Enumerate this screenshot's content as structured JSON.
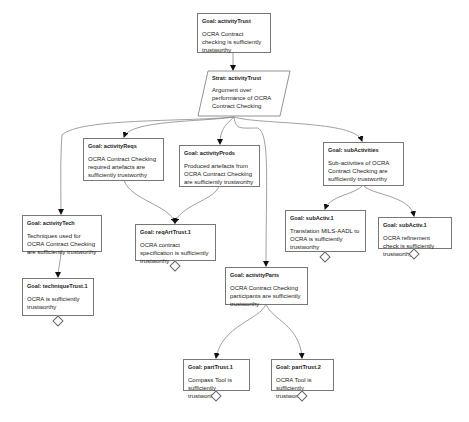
{
  "diagram": {
    "type": "GSN assurance case",
    "nodes": {
      "activityTrust": {
        "kind": "goal",
        "title": "Goal: activityTrust",
        "text": "OCRA Contract checking is sufficiently trustworthy"
      },
      "stratActivityTrust": {
        "kind": "strategy",
        "title": "Strat: activityTrust",
        "text": "Argument over performance of OCRA Contract Checking"
      },
      "activityReqs": {
        "kind": "goal",
        "title": "Goal: activityReqs",
        "text": "OCRA Contract Checking required artefacts are sufficiently trustworthy"
      },
      "activityProds": {
        "kind": "goal",
        "title": "Goal: activityProds",
        "text": "Produced artefacts from OCRA Contract Checking are sufficiently trustworthy"
      },
      "subActivities": {
        "kind": "goal",
        "title": "Goal: subActivities",
        "text": "Sub-activities of OCRA Contract Checking are sufficiently trustworthy"
      },
      "activityTech": {
        "kind": "goal",
        "title": "Goal: activityTech",
        "text": "Techniques used for OCRA Contract Checking are sufficiently trustworthy"
      },
      "reqArtTrust1": {
        "kind": "goal",
        "title": "Goal: reqArtTrust.1",
        "text": "OCRA contract specification is sufficiently trustworthy",
        "undeveloped": true
      },
      "subActiv1a": {
        "kind": "goal",
        "title": "Goal: subActiv.1",
        "text": "Translation MILS-AADL to OCRA is sufficiently trustworthy",
        "undeveloped": true
      },
      "subActiv1b": {
        "kind": "goal",
        "title": "Goal: subActiv.1",
        "text": "OCRA refinement check is sufficiently trustworthy",
        "undeveloped": true
      },
      "techniqueTrust1": {
        "kind": "goal",
        "title": "Goal: techniqueTrust.1",
        "text": "OCRA is sufficiently trustworthy",
        "undeveloped": true
      },
      "activityParts": {
        "kind": "goal",
        "title": "Goal: activityParts",
        "text": "OCRA Contract Checking participants are sufficiently trustworthy"
      },
      "partTrust1": {
        "kind": "goal",
        "title": "Goal: partTrust.1",
        "text": "Compass Tool is sufficiently trustworthy",
        "undeveloped": true
      },
      "partTrust2": {
        "kind": "goal",
        "title": "Goal: partTrust.2",
        "text": "OCRA Tool is sufficiently trustworthy",
        "undeveloped": true
      }
    },
    "edges": [
      [
        "activityTrust",
        "stratActivityTrust"
      ],
      [
        "stratActivityTrust",
        "activityReqs"
      ],
      [
        "stratActivityTrust",
        "activityProds"
      ],
      [
        "stratActivityTrust",
        "subActivities"
      ],
      [
        "stratActivityTrust",
        "activityTech"
      ],
      [
        "stratActivityTrust",
        "activityParts"
      ],
      [
        "activityReqs",
        "reqArtTrust1"
      ],
      [
        "activityProds",
        "reqArtTrust1"
      ],
      [
        "subActivities",
        "subActiv1a"
      ],
      [
        "subActivities",
        "subActiv1b"
      ],
      [
        "activityTech",
        "techniqueTrust1"
      ],
      [
        "activityParts",
        "partTrust1"
      ],
      [
        "activityParts",
        "partTrust2"
      ]
    ],
    "colors": {
      "line": "#777777",
      "border": "#777777",
      "arrow": "#111111"
    }
  }
}
